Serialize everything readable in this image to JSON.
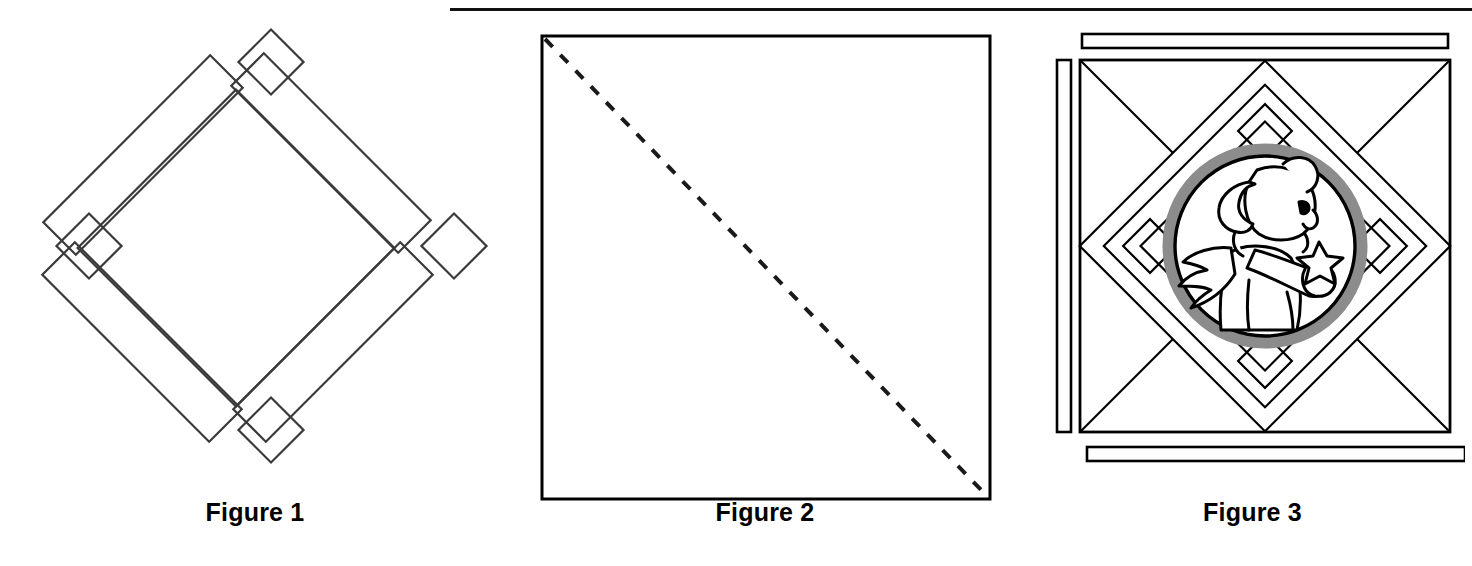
{
  "page": {
    "background_color": "#ffffff",
    "ink_color": "#000000",
    "accent_gray": "#8c8c8c",
    "top_rule": {
      "name": "horizontal-rule",
      "color": "#111111"
    }
  },
  "figures": [
    {
      "id": "figure-1",
      "caption": "Figure 1",
      "description": "diamond-lattice quilt frame outline",
      "shapes": {
        "center_diamond": "open diamond",
        "side_strips": 4,
        "corner_squares": 4
      }
    },
    {
      "id": "figure-2",
      "caption": "Figure 2",
      "description": "square with dashed diagonal fold line",
      "shapes": {
        "square": "plain square outline",
        "diagonal": "dashed line top-left to bottom-right"
      }
    },
    {
      "id": "figure-3",
      "caption": "Figure 3",
      "description": "finished quilt block with angel medallion",
      "shapes": {
        "border_strips": 3,
        "diamond_lattice": "on-point diamond band with corner diamonds",
        "medallion_ring_color": "#8c8c8c",
        "motif": "angel holding a star"
      }
    }
  ]
}
